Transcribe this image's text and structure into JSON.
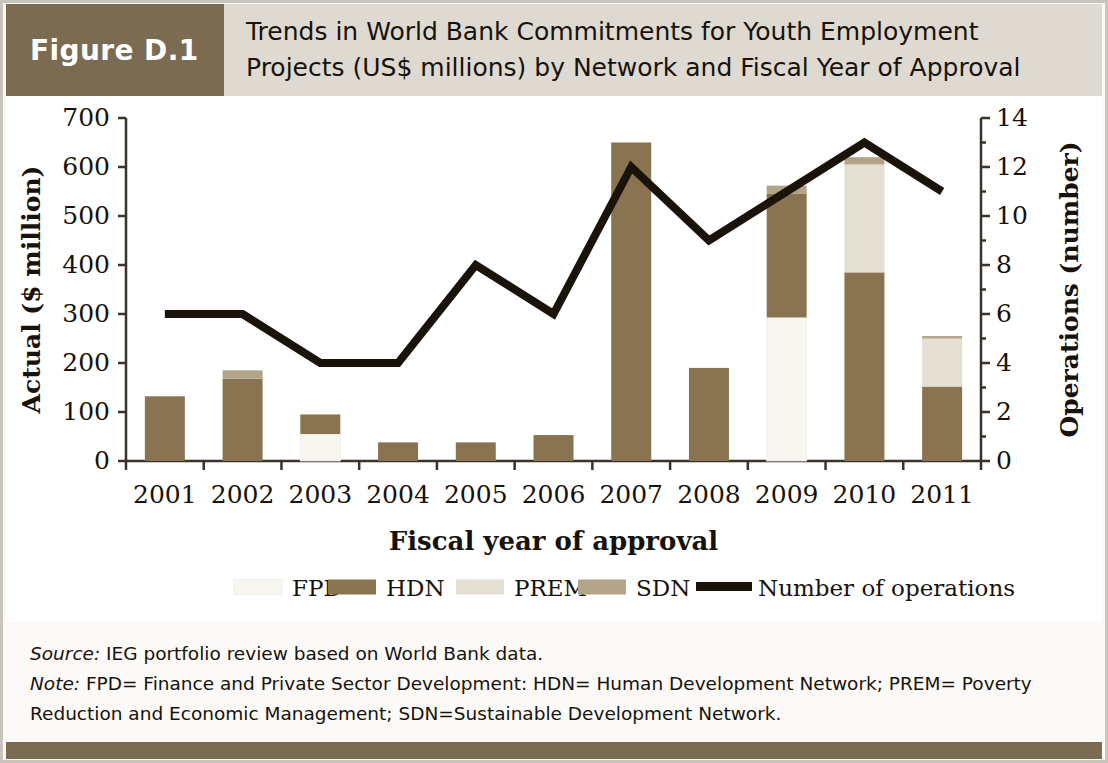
{
  "header": {
    "figure_tag": "Figure D.1",
    "title_line1": "Trends in World Bank Commitments for Youth Employment",
    "title_line2": "Projects (US$ millions) by Network and Fiscal Year of Approval"
  },
  "notes": {
    "source_label": "Source:",
    "source_text": " IEG portfolio review based on World Bank data.",
    "note_label": "Note:",
    "note_text_line1": " FPD= Finance and Private Sector Development: HDN= Human Development Network; PREM= Poverty",
    "note_text_line2": "Reduction and Economic Management; SDN=Sustainable Development Network."
  },
  "colors": {
    "fpd": "#f7f6f1",
    "hdn": "#8a7350",
    "prem": "#e4dfd2",
    "sdn": "#b2a488",
    "line": "#1a1309",
    "header_tag_bg": "#7b6b51",
    "header_bg": "#dedad1",
    "axis": "#3a332a"
  },
  "chart_data": {
    "type": "bar",
    "title": "Trends in World Bank Commitments for Youth Employment Projects (US$ millions) by Network and Fiscal Year of Approval",
    "xlabel": "Fiscal year of approval",
    "ylabel": "Actual ($ million)",
    "y2label": "Operations (number)",
    "categories": [
      "2001",
      "2002",
      "2003",
      "2004",
      "2005",
      "2006",
      "2007",
      "2008",
      "2009",
      "2010",
      "2011"
    ],
    "ylim": [
      0,
      700
    ],
    "yticks": [
      0,
      100,
      200,
      300,
      400,
      500,
      600,
      700
    ],
    "y2lim": [
      0,
      14
    ],
    "y2ticks": [
      0,
      2,
      4,
      6,
      8,
      10,
      12,
      14
    ],
    "grid": false,
    "legend_position": "bottom",
    "stacked": true,
    "series": [
      {
        "name": "FPD",
        "axis": "left",
        "values": [
          0,
          0,
          55,
          0,
          0,
          0,
          0,
          0,
          293,
          0,
          0
        ]
      },
      {
        "name": "HDN",
        "axis": "left",
        "values": [
          132,
          168,
          40,
          38,
          38,
          53,
          650,
          190,
          252,
          385,
          152
        ]
      },
      {
        "name": "PREM",
        "axis": "left",
        "values": [
          0,
          0,
          0,
          0,
          0,
          0,
          0,
          0,
          0,
          220,
          98
        ]
      },
      {
        "name": "SDN",
        "axis": "left",
        "values": [
          0,
          17,
          0,
          0,
          0,
          0,
          0,
          0,
          17,
          15,
          5
        ]
      }
    ],
    "totals": [
      132,
      185,
      95,
      38,
      38,
      53,
      650,
      190,
      562,
      620,
      255
    ],
    "line_series": {
      "name": "Number of operations",
      "axis": "right",
      "values": [
        6,
        6,
        4,
        4,
        8,
        6,
        12,
        9,
        11,
        13,
        11
      ]
    },
    "legend": [
      {
        "label": "FPD",
        "type": "swatch",
        "color": "#f7f6f1"
      },
      {
        "label": "HDN",
        "type": "swatch",
        "color": "#8a7350"
      },
      {
        "label": "PREM",
        "type": "swatch",
        "color": "#e4dfd2"
      },
      {
        "label": "SDN",
        "type": "swatch",
        "color": "#b2a488"
      },
      {
        "label": "Number of operations",
        "type": "line",
        "color": "#1a1309"
      }
    ]
  }
}
